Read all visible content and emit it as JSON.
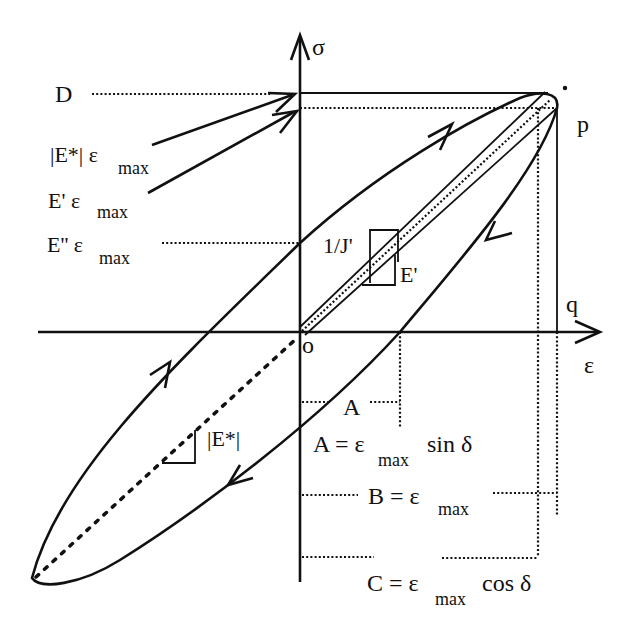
{
  "diagram": {
    "axes": {
      "y_label": "σ",
      "x_label": "ε",
      "origin_label": "o"
    },
    "points": {
      "p": "p",
      "q": "q"
    },
    "left_labels": {
      "d": "D",
      "e_star_mag": "|E*| ε",
      "e_star_mag_sub": "max",
      "e_prime": "E' ε",
      "e_prime_sub": "max",
      "e_double_prime": "E'' ε",
      "e_double_prime_sub": "max"
    },
    "slope_labels": {
      "inv_j_prime": "1/J'",
      "e_prime": "E'",
      "e_star": "|E*|"
    },
    "dimension_labels": {
      "a_short": "A",
      "a_eq_prefix": "A = ε",
      "a_eq_sub": "max",
      "a_eq_suffix": " sin δ",
      "b_eq_prefix": "B = ε",
      "b_eq_sub": "max",
      "c_eq_prefix": "C = ε",
      "c_eq_sub": "max",
      "c_eq_suffix": " cos δ"
    }
  }
}
